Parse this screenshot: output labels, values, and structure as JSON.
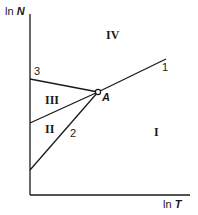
{
  "diagram": {
    "axes": {
      "y_label_prefix": "ln ",
      "y_label_var": "N",
      "x_label_prefix": "ln ",
      "x_label_var": "T"
    },
    "point": {
      "label": "A"
    },
    "lines": [
      {
        "id": "1",
        "label": "1"
      },
      {
        "id": "2",
        "label": "2"
      },
      {
        "id": "3",
        "label": "3"
      }
    ],
    "regions": [
      {
        "id": "I",
        "label": "I"
      },
      {
        "id": "II",
        "label": "II"
      },
      {
        "id": "III",
        "label": "III"
      },
      {
        "id": "IV",
        "label": "IV"
      }
    ],
    "colors": {
      "ink": "#1a1a1a",
      "background": "#ffffff"
    }
  }
}
